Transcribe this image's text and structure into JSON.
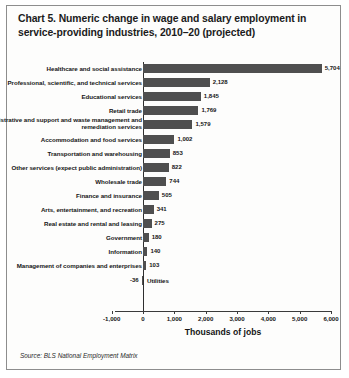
{
  "title": "Chart 5. Numeric change in wage and salary employment in service-providing industries, 2010–20 (projected)",
  "source": "Source: BLS National Employment Matrix",
  "chart_data": {
    "type": "bar",
    "orientation": "horizontal",
    "title": "Chart 5. Numeric change in wage and salary employment in service-providing industries, 2010–20 (projected)",
    "xlabel": "Thousands of jobs",
    "ylabel": "",
    "xlim": [
      -1000,
      6000
    ],
    "grid": false,
    "legend": false,
    "categories": [
      "Healthcare and social assistance",
      "Professional, scientific, and technical services",
      "Educational services",
      "Retail trade",
      "Administrative and support and waste management and remediation services",
      "Accommodation and food services",
      "Transportation and warehousing",
      "Other services (expect public administration)",
      "Wholesale trade",
      "Finance and insurance",
      "Arts, entertainment, and recreation",
      "Real estate and rental and leasing",
      "Government",
      "Information",
      "Management of companies and enterprises",
      "Utilities"
    ],
    "values": [
      5704,
      2128,
      1845,
      1769,
      1579,
      1002,
      853,
      822,
      744,
      505,
      341,
      275,
      180,
      140,
      103,
      -36
    ],
    "value_labels": [
      "5,704",
      "2,128",
      "1,845",
      "1,769",
      "1,579",
      "1,002",
      "853",
      "822",
      "744",
      "505",
      "341",
      "275",
      "180",
      "140",
      "103",
      "-36"
    ],
    "xticks": [
      -1000,
      0,
      1000,
      2000,
      3000,
      4000,
      5000,
      6000
    ],
    "xtick_labels": [
      "-1,000",
      "0",
      "1,000",
      "2,000",
      "3,000",
      "4,000",
      "5,000",
      "6,000"
    ],
    "bar_color": "#4f4f4f",
    "axis_color": "#3b3b3b"
  }
}
